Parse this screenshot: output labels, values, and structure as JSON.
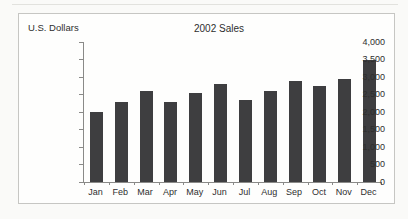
{
  "chart_data": {
    "type": "bar",
    "title": "2002 Sales",
    "unit_label": "U.S. Dollars",
    "categories": [
      "Jan",
      "Feb",
      "Mar",
      "Apr",
      "May",
      "Jun",
      "Jul",
      "Aug",
      "Sep",
      "Oct",
      "Nov",
      "Dec"
    ],
    "values": [
      2000,
      2300,
      2600,
      2300,
      2550,
      2800,
      2350,
      2600,
      2900,
      2750,
      2950,
      3500
    ],
    "xlabel": "",
    "ylabel": "U.S. Dollars",
    "ylim": [
      0,
      4000
    ],
    "y_tick_step": 500,
    "y_tick_labels": [
      "0",
      "500",
      "1,000",
      "1,500",
      "2,000",
      "2,500",
      "3,000",
      "3,500",
      "4,000"
    ],
    "grid": false,
    "legend": "none",
    "bar_color": "#3e3e40",
    "axis_color": "#8a8a88",
    "text_color": "#2e2e2e"
  }
}
